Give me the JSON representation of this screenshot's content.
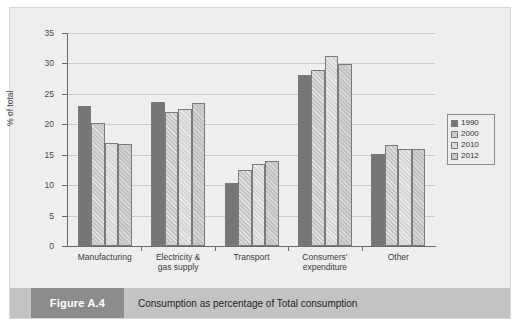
{
  "figure": {
    "tag": "Figure A.4",
    "caption": "Consumption as percentage of Total consumption"
  },
  "chart_data": {
    "type": "bar",
    "title": "",
    "xlabel": "",
    "ylabel": "% of total",
    "ylim": [
      0,
      35
    ],
    "yticks": [
      0,
      5,
      10,
      15,
      20,
      25,
      30,
      35
    ],
    "ytick_labels": [
      "0",
      "5",
      "10",
      "15",
      "20",
      "25",
      "30",
      "35"
    ],
    "grid": true,
    "legend_position": "right",
    "categories": [
      "Manufacturing",
      "Electricity & gas supply",
      "Transport",
      "Consumers' expenditure",
      "Other"
    ],
    "category_lines": [
      [
        "Manufacturing"
      ],
      [
        "Electricity &",
        "gas supply"
      ],
      [
        "Transport"
      ],
      [
        "Consumers'",
        "expenditure"
      ],
      [
        "Other"
      ]
    ],
    "series": [
      {
        "name": "1990",
        "color": "#767676",
        "values": [
          23.0,
          23.7,
          10.4,
          28.1,
          15.2
        ]
      },
      {
        "name": "2000",
        "color": "#c6c6c6",
        "values": [
          20.2,
          22.0,
          12.5,
          29.0,
          16.6
        ]
      },
      {
        "name": "2010",
        "color": "#d6d6d6",
        "values": [
          17.0,
          22.5,
          13.5,
          31.2,
          16.0
        ]
      },
      {
        "name": "2012",
        "color": "#c2c2c2",
        "values": [
          16.8,
          23.5,
          14.0,
          29.9,
          16.0
        ]
      }
    ]
  },
  "colors": {
    "panel_background": "#eeeeee",
    "caption_tag_background": "#8c8c8c",
    "caption_bar_background": "#c3c3c3",
    "axis": "#6b6b6b",
    "gridline": "#c9c9c9"
  }
}
